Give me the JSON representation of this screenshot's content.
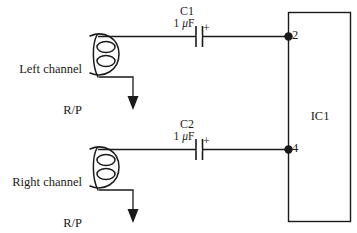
{
  "diagram": {
    "background_color": "#ffffff",
    "line_color": "#1a1a1a"
  },
  "channels": [
    {
      "id": "left",
      "source_label_line1": "Left channel",
      "source_label_line2": "R/P",
      "source_icon": "tape-head-coil-icon",
      "ground_icon": "ground-arrow-icon",
      "capacitor": {
        "name": "C1",
        "value": "1 μF",
        "value_prefix": "1 ",
        "value_unit_mu": "μ",
        "value_unit_f": "F",
        "polarity": "+",
        "icon": "polarized-capacitor-icon"
      },
      "pin": {
        "number": "2",
        "node_icon": "junction-dot-icon"
      }
    },
    {
      "id": "right",
      "source_label_line1": "Right channel",
      "source_label_line2": "R/P",
      "source_icon": "tape-head-coil-icon",
      "ground_icon": "ground-arrow-icon",
      "capacitor": {
        "name": "C2",
        "value": "1 μF",
        "value_prefix": "1 ",
        "value_unit_mu": "μ",
        "value_unit_f": "F",
        "polarity": "+",
        "icon": "polarized-capacitor-icon"
      },
      "pin": {
        "number": "4",
        "node_icon": "junction-dot-icon"
      }
    }
  ],
  "ic": {
    "label": "IC1",
    "shape": "rectangle"
  }
}
